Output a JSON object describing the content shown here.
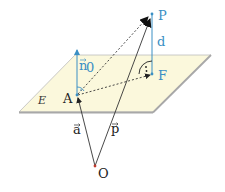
{
  "diagram": {
    "type": "geometry-3d",
    "colors": {
      "plane_fill": "#fbf8dc",
      "plane_edge": "#a8a8a8",
      "accent_blue": "#3a8fc4",
      "line_dark": "#333333",
      "origin_dot": "#c0392b"
    },
    "points": {
      "P": {
        "label": "P",
        "x": 152,
        "y": 14
      },
      "F": {
        "label": "F",
        "x": 152,
        "y": 74
      },
      "A": {
        "label": "A",
        "x": 77,
        "y": 95
      },
      "O": {
        "label": "O",
        "x": 95,
        "y": 166
      }
    },
    "labels": {
      "plane": "E",
      "normal": "n⃗0",
      "normal_base": "n",
      "normal_sub": "0",
      "distance": "d",
      "vec_a": "a⃗",
      "vec_a_base": "a",
      "vec_p_base": "p",
      "point_P": "P",
      "point_F": "F",
      "point_A": "A",
      "point_O": "O",
      "right_angle_mark": "·"
    }
  }
}
